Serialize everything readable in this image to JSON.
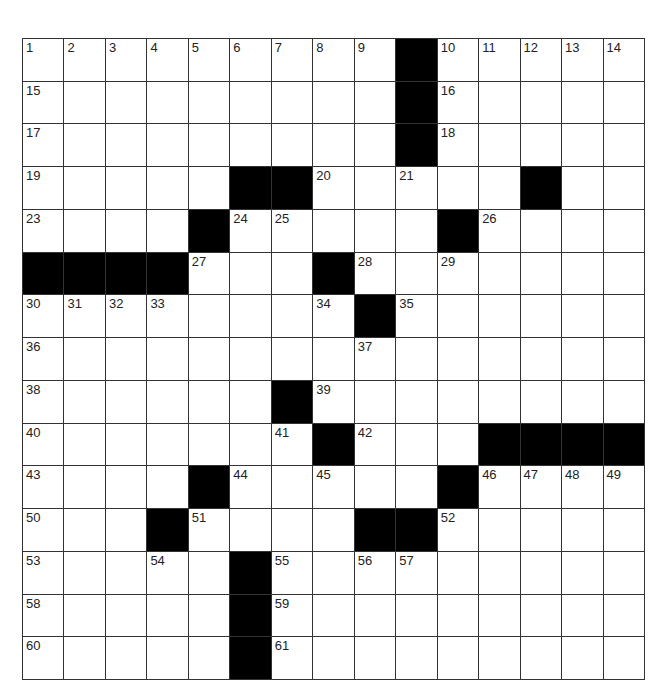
{
  "puzzle": {
    "rows": 15,
    "cols": 15,
    "colors": {
      "block": "#000000",
      "cell": "#ffffff",
      "line": "#333333"
    },
    "layout": [
      "#########.#####",
      "#########.#####",
      "#########.#####",
      "#####..#####.##",
      "####.#####.####",
      "....###.#######",
      "########.######",
      "###############",
      "######.########",
      "#######.###....",
      "####.#####.####",
      "###.####..#####",
      "#####.#########",
      "#####.#########",
      "#####.#########"
    ],
    "numbers": [
      [
        1,
        2,
        3,
        4,
        5,
        6,
        7,
        8,
        9,
        0,
        10,
        11,
        12,
        13,
        14
      ],
      [
        15,
        0,
        0,
        0,
        0,
        0,
        0,
        0,
        0,
        0,
        16,
        0,
        0,
        0,
        0
      ],
      [
        17,
        0,
        0,
        0,
        0,
        0,
        0,
        0,
        0,
        0,
        18,
        0,
        0,
        0,
        0
      ],
      [
        19,
        0,
        0,
        0,
        0,
        0,
        0,
        20,
        0,
        21,
        0,
        0,
        22,
        0,
        0
      ],
      [
        23,
        0,
        0,
        0,
        0,
        24,
        25,
        0,
        0,
        0,
        0,
        26,
        0,
        0,
        0
      ],
      [
        0,
        0,
        0,
        0,
        27,
        0,
        0,
        0,
        28,
        0,
        29,
        0,
        0,
        0,
        0
      ],
      [
        30,
        31,
        32,
        33,
        0,
        0,
        0,
        34,
        0,
        35,
        0,
        0,
        0,
        0,
        0
      ],
      [
        36,
        0,
        0,
        0,
        0,
        0,
        0,
        0,
        37,
        0,
        0,
        0,
        0,
        0,
        0
      ],
      [
        38,
        0,
        0,
        0,
        0,
        0,
        0,
        39,
        0,
        0,
        0,
        0,
        0,
        0,
        0
      ],
      [
        40,
        0,
        0,
        0,
        0,
        0,
        41,
        0,
        42,
        0,
        0,
        0,
        0,
        0,
        0
      ],
      [
        43,
        0,
        0,
        0,
        0,
        44,
        0,
        45,
        0,
        0,
        0,
        46,
        47,
        48,
        49
      ],
      [
        50,
        0,
        0,
        0,
        51,
        0,
        0,
        0,
        0,
        0,
        52,
        0,
        0,
        0,
        0
      ],
      [
        53,
        0,
        0,
        54,
        0,
        0,
        55,
        0,
        56,
        57,
        0,
        0,
        0,
        0,
        0
      ],
      [
        58,
        0,
        0,
        0,
        0,
        0,
        59,
        0,
        0,
        0,
        0,
        0,
        0,
        0,
        0
      ],
      [
        60,
        0,
        0,
        0,
        0,
        0,
        61,
        0,
        0,
        0,
        0,
        0,
        0,
        0,
        0
      ]
    ]
  }
}
